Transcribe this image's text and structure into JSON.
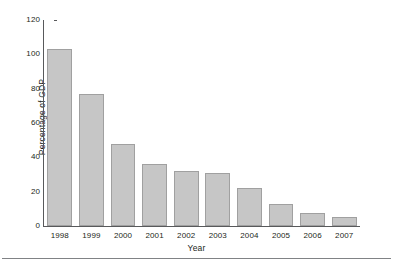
{
  "chart_data": {
    "type": "bar",
    "title": "",
    "xlabel": "Year",
    "ylabel": "Percentage of GDP",
    "categories": [
      "1998",
      "1999",
      "2000",
      "2001",
      "2002",
      "2003",
      "2004",
      "2005",
      "2006",
      "2007"
    ],
    "values": [
      103,
      77,
      48,
      36,
      32,
      31,
      22,
      13,
      7.5,
      5.5
    ],
    "ylim": [
      0,
      120
    ],
    "yticks": [
      0,
      20,
      40,
      60,
      80,
      100,
      120
    ],
    "ytick_labels": [
      "0",
      "20",
      "40",
      "60",
      "80",
      "100",
      "120"
    ],
    "grid": false,
    "legend": "none",
    "bar_color": "#c6c6c6",
    "bar_edge_color": "#a0a0a0",
    "axis_color": "#58595b",
    "background": "#ffffff"
  }
}
